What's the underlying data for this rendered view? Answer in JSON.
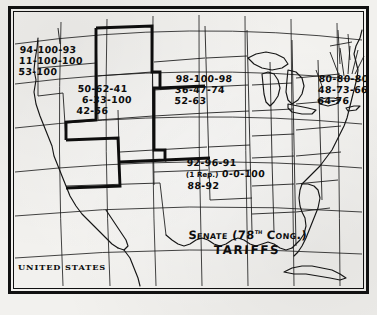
{
  "map": {
    "title_line1": "Senate (78",
    "title_superscript": "th",
    "title_line1_end": " Cong.)",
    "title_line2": "TARIFFS",
    "country_label": "UNITED STATES"
  },
  "regions": [
    {
      "id": "pacific-northwest",
      "name": "Pacific Northwest group",
      "row1": "94-100-93",
      "row2": "11-100-100",
      "row3": "53-100"
    },
    {
      "id": "mountain",
      "name": "Mountain states group",
      "row1": "50-62-41",
      "row2": "6-33-100",
      "row3": "42-56"
    },
    {
      "id": "plains-midwest",
      "name": "Plains and Midwest group",
      "row1": "98-100-98",
      "row2": "36-47-74",
      "row3": "52-63"
    },
    {
      "id": "northeast",
      "name": "Northeast group",
      "row1": "80-80-80",
      "row2": "48-73-66",
      "row3": "64-76"
    },
    {
      "id": "south",
      "name": "Southern group",
      "row1": "92-96-91",
      "row2_prefix": "(1 Rep.)",
      "row2": "0-0-100",
      "row3": "88-92"
    }
  ],
  "style": {
    "ink": "#111111",
    "paper": "#f2f1ee"
  }
}
